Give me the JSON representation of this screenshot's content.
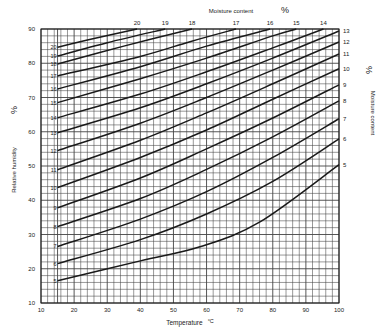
{
  "chart_data": {
    "type": "line",
    "title": "",
    "xlabel": "Temperature °C",
    "ylabel": "Relative humidity %",
    "secondary_label": "Moisture content %",
    "xlim": [
      10,
      100
    ],
    "ylim": [
      10,
      90
    ],
    "x_ticks": [
      10,
      20,
      30,
      40,
      50,
      60,
      70,
      80,
      90,
      100
    ],
    "y_ticks": [
      10,
      20,
      30,
      40,
      50,
      60,
      70,
      80,
      90
    ],
    "grid": {
      "on": true,
      "minor_step_x": 2,
      "minor_step_y": 2,
      "extra_vertical_at": 15
    },
    "series": [
      {
        "name": "5",
        "x": [
          15,
          40,
          58,
          76,
          100
        ],
        "y": [
          16.5,
          22.3,
          26.4,
          33.6,
          50.4
        ]
      },
      {
        "name": "6",
        "x": [
          15,
          40,
          60,
          80,
          100
        ],
        "y": [
          21.5,
          28.5,
          36.0,
          45.5,
          57.9
        ]
      },
      {
        "name": "7",
        "x": [
          15,
          40,
          60,
          80,
          100
        ],
        "y": [
          26.5,
          34.5,
          42.5,
          52.5,
          63.8
        ]
      },
      {
        "name": "8",
        "x": [
          15,
          40,
          60,
          80,
          100
        ],
        "y": [
          32.3,
          40.5,
          49.0,
          58.5,
          69.0
        ]
      },
      {
        "name": "9",
        "x": [
          15,
          40,
          60,
          80,
          100
        ],
        "y": [
          37.8,
          46.5,
          55.0,
          64.0,
          73.7
        ]
      },
      {
        "name": "10",
        "x": [
          15,
          40,
          60,
          80,
          100
        ],
        "y": [
          43.7,
          52.5,
          60.5,
          69.5,
          78.4
        ]
      },
      {
        "name": "11",
        "x": [
          15,
          40,
          60,
          80,
          100
        ],
        "y": [
          48.9,
          57.5,
          65.5,
          74.0,
          82.7
        ]
      },
      {
        "name": "12",
        "x": [
          15,
          40,
          60,
          80,
          100
        ],
        "y": [
          54.5,
          62.5,
          70.0,
          78.0,
          86.2
        ]
      },
      {
        "name": "13",
        "x": [
          15,
          40,
          60,
          80,
          100
        ],
        "y": [
          59.7,
          67.0,
          74.0,
          81.5,
          89.4
        ]
      },
      {
        "name": "14",
        "x": [
          15,
          40,
          60,
          80,
          95.3
        ],
        "y": [
          64.1,
          71.0,
          77.5,
          84.5,
          90
        ]
      },
      {
        "name": "15",
        "x": [
          15,
          40,
          60,
          80,
          87.1
        ],
        "y": [
          68.5,
          75.5,
          81.5,
          88.0,
          90
        ]
      },
      {
        "name": "16",
        "x": [
          15,
          40,
          60,
          79.2
        ],
        "y": [
          72.5,
          79.0,
          85.0,
          90
        ]
      },
      {
        "name": "17",
        "x": [
          15,
          40,
          55,
          68.9
        ],
        "y": [
          76.3,
          82.0,
          86.3,
          90
        ]
      },
      {
        "name": "18",
        "x": [
          15,
          35,
          55.6
        ],
        "y": [
          79.8,
          85.0,
          90
        ]
      },
      {
        "name": "19",
        "x": [
          15,
          30,
          47.5
        ],
        "y": [
          82.1,
          86.0,
          90
        ]
      },
      {
        "name": "20",
        "x": [
          15,
          25,
          39
        ],
        "y": [
          84.7,
          87.0,
          90
        ]
      }
    ],
    "top_labels": [
      {
        "label": "20",
        "x": 39
      },
      {
        "label": "19",
        "x": 47.5
      },
      {
        "label": "18",
        "x": 55.6
      },
      {
        "label": "17",
        "x": 68.9
      },
      {
        "label": "16",
        "x": 79.2
      },
      {
        "label": "15",
        "x": 87.1
      },
      {
        "label": "14",
        "x": 95.3
      }
    ],
    "right_labels": [
      {
        "label": "13",
        "y": 89.4
      },
      {
        "label": "12",
        "y": 86.2
      },
      {
        "label": "11",
        "y": 82.7
      },
      {
        "label": "10",
        "y": 78.4
      },
      {
        "label": "9",
        "y": 73.7
      },
      {
        "label": "8",
        "y": 69.0
      },
      {
        "label": "7",
        "y": 63.8
      },
      {
        "label": "6",
        "y": 57.9
      },
      {
        "label": "5",
        "y": 50.4
      }
    ],
    "legend": "none"
  },
  "labels": {
    "xlabel": "Temperature",
    "xunit": "°C",
    "ylabel": "Relative   humidity",
    "yunit": "%",
    "top_title": "Moisture    content",
    "top_unit": "%",
    "right_title": "Moisture    content",
    "right_unit": "%"
  },
  "colors": {
    "line": "#1a1a1a",
    "grid": "#444444",
    "background": "#ffffff"
  }
}
